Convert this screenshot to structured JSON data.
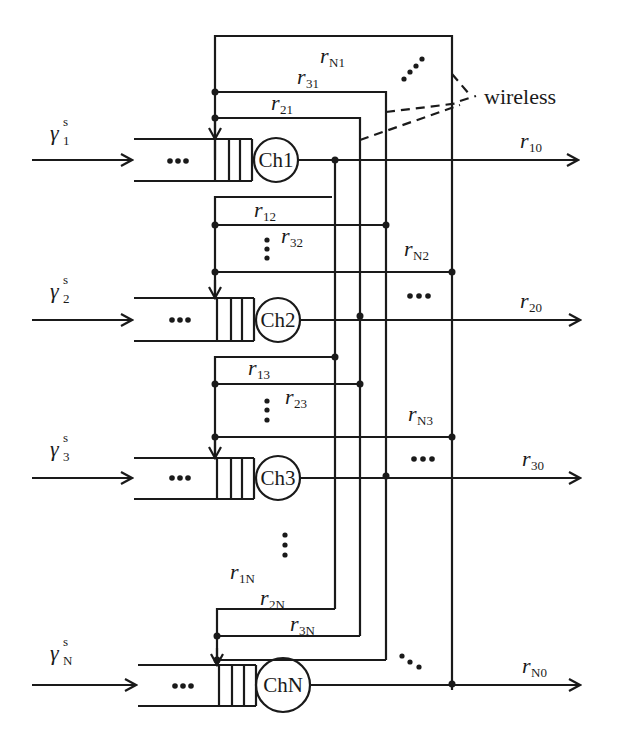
{
  "diagram": {
    "annotation": {
      "wireless_label": "wireless"
    },
    "channels": [
      {
        "id": "ch1",
        "label": "Ch1",
        "arrival_symbol": "γ",
        "arrival_sup": "s",
        "arrival_sub": "1",
        "output_symbol": "r",
        "output_sub": "10"
      },
      {
        "id": "ch2",
        "label": "Ch2",
        "arrival_symbol": "γ",
        "arrival_sup": "s",
        "arrival_sub": "2",
        "output_symbol": "r",
        "output_sub": "20"
      },
      {
        "id": "ch3",
        "label": "Ch3",
        "arrival_symbol": "γ",
        "arrival_sup": "s",
        "arrival_sub": "3",
        "output_symbol": "r",
        "output_sub": "30"
      },
      {
        "id": "chN",
        "label": "ChN",
        "arrival_symbol": "γ",
        "arrival_sup": "s",
        "arrival_sub": "N",
        "output_symbol": "r",
        "output_sub": "N0"
      }
    ],
    "transfer_rates": [
      {
        "symbol": "r",
        "sub": "N1"
      },
      {
        "symbol": "r",
        "sub": "31"
      },
      {
        "symbol": "r",
        "sub": "21"
      },
      {
        "symbol": "r",
        "sub": "12"
      },
      {
        "symbol": "r",
        "sub": "32"
      },
      {
        "symbol": "r",
        "sub": "N2"
      },
      {
        "symbol": "r",
        "sub": "13"
      },
      {
        "symbol": "r",
        "sub": "23"
      },
      {
        "symbol": "r",
        "sub": "N3"
      },
      {
        "symbol": "r",
        "sub": "1N"
      },
      {
        "symbol": "r",
        "sub": "2N"
      },
      {
        "symbol": "r",
        "sub": "3N"
      }
    ],
    "ellipsis": "•••",
    "vertical_ellipsis": "⋮"
  }
}
